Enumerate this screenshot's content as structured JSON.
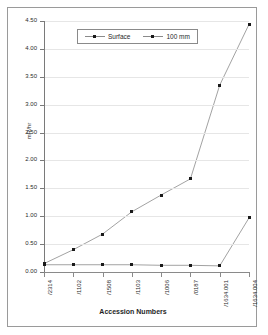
{
  "chart_data": {
    "type": "line",
    "title": "",
    "xlabel": "Accession Numbers",
    "ylabel": "mR/hr",
    "ylim": [
      0.0,
      4.5
    ],
    "ytick_labels": [
      "0.00",
      "0.50",
      "1.00",
      "1.50",
      "2.00",
      "2.50",
      "3.00",
      "3.50",
      "4.00",
      "4.50"
    ],
    "ytick_values": [
      0.0,
      0.5,
      1.0,
      1.5,
      2.0,
      2.5,
      3.0,
      3.5,
      4.0,
      4.5
    ],
    "grid": true,
    "legend_position": "top-center",
    "categories": [
      "/2314",
      "/1102",
      "/1508",
      "/1103",
      "/1006",
      "/0187",
      "/1634.001",
      "/1634.004"
    ],
    "series": [
      {
        "name": "Surface",
        "values": [
          0.15,
          0.4,
          0.68,
          1.08,
          1.38,
          1.67,
          3.35,
          4.44
        ]
      },
      {
        "name": "100 mm",
        "values": [
          0.13,
          0.13,
          0.13,
          0.13,
          0.12,
          0.12,
          0.11,
          0.97
        ]
      }
    ],
    "colors": {
      "line": "#8a8a8a",
      "marker": "#1a1a1a",
      "grid": "#e6e6e6",
      "axis": "#7a7a7a",
      "frame": "#9a9a9a",
      "text": "#2b2b2b"
    }
  }
}
